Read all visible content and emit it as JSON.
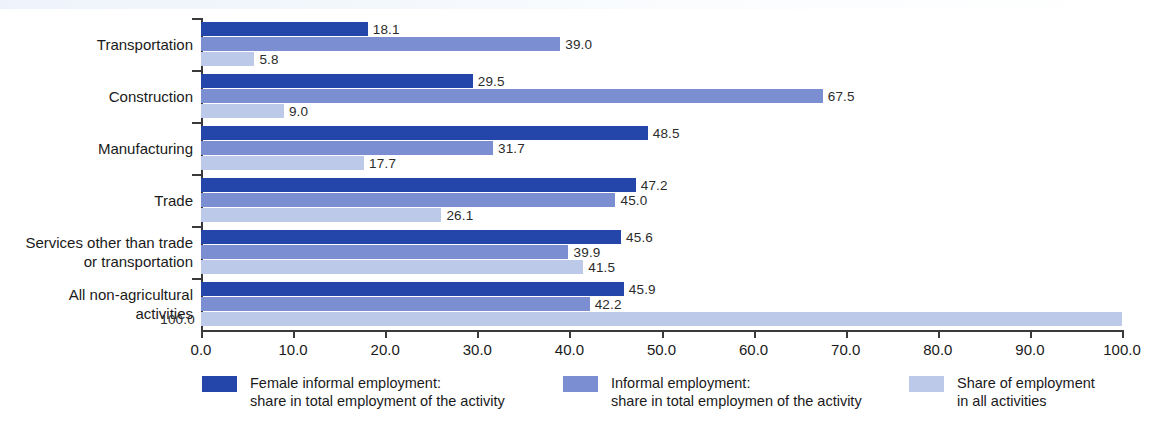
{
  "chart_data": {
    "type": "bar",
    "orientation": "horizontal",
    "title": "",
    "subtitle": "",
    "xlabel": "",
    "ylabel": "",
    "xlim": [
      0.0,
      100.0
    ],
    "xticks": [
      "0.0",
      "10.0",
      "20.0",
      "30.0",
      "40.0",
      "50.0",
      "60.0",
      "70.0",
      "80.0",
      "90.0",
      "100.0"
    ],
    "xtick_values": [
      0,
      10,
      20,
      30,
      40,
      50,
      60,
      70,
      80,
      90,
      100
    ],
    "grid": false,
    "legend_position": "bottom",
    "categories": [
      "Transportation",
      "Construction",
      "Manufacturing",
      "Trade",
      "Services other than trade\nor transportation",
      "All non-agricultural\nactivities"
    ],
    "series": [
      {
        "name": "Female informal employment:\nshare in total employment of the activity",
        "color": "#2446ab",
        "values": [
          18.1,
          29.5,
          48.5,
          47.2,
          45.6,
          45.9
        ],
        "labels": [
          "18.1",
          "29.5",
          "48.5",
          "47.2",
          "45.6",
          "45.9"
        ]
      },
      {
        "name": "Informal employment:\nshare in total employmen of the activity",
        "color": "#7b8ed2",
        "values": [
          39.0,
          67.5,
          31.7,
          45.0,
          39.9,
          42.2
        ],
        "labels": [
          "39.0",
          "67.5",
          "31.7",
          "45.0",
          "39.9",
          "42.2"
        ]
      },
      {
        "name": "Share of employment\nin all activities",
        "color": "#bcc9e8",
        "values": [
          5.8,
          9.0,
          17.7,
          26.1,
          41.5,
          100.0
        ],
        "labels": [
          "5.8",
          "9.0",
          "17.7",
          "26.1",
          "41.5",
          "100.0"
        ]
      }
    ]
  },
  "legend": {
    "items": [
      {
        "swatch": "s0",
        "text": "Female informal employment:\nshare in total employment of the activity"
      },
      {
        "swatch": "s1",
        "text": "Informal employment:\nshare in total employmen of the activity"
      },
      {
        "swatch": "s2",
        "text": "Share of employment\nin all activities"
      }
    ]
  },
  "axis": {
    "x_tick_labels": [
      "0.0",
      "10.0",
      "20.0",
      "30.0",
      "40.0",
      "50.0",
      "60.0",
      "70.0",
      "80.0",
      "90.0",
      "100.0"
    ]
  }
}
